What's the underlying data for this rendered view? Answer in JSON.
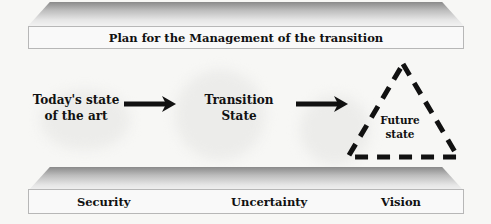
{
  "top_banner": {
    "label": "Plan for the Management of the transition"
  },
  "nodes": [
    {
      "id": "today",
      "line1": "Today's state",
      "line2": "of the art"
    },
    {
      "id": "transition",
      "line1": "Transition",
      "line2": "State"
    },
    {
      "id": "future",
      "line1": "Future",
      "line2": "state"
    }
  ],
  "bottom_banner": {
    "pillars": [
      "Security",
      "Uncertainty",
      "Vision"
    ]
  },
  "colors": {
    "bevel_dark": "#8a8a8a",
    "box_border": "#b7b7b7",
    "ink": "#111111"
  }
}
